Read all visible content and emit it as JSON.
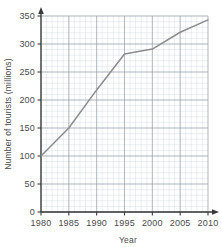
{
  "chart_data": {
    "type": "line",
    "title": "",
    "xlabel": "Year",
    "ylabel": "Number of tourists (millions)",
    "x": [
      1980,
      1985,
      1990,
      1995,
      2000,
      2005,
      2010
    ],
    "values": [
      100,
      150,
      218,
      282,
      291,
      321,
      343
    ],
    "series": [
      {
        "name": "Number of tourists",
        "values": [
          100,
          150,
          218,
          282,
          291,
          321,
          343
        ]
      }
    ],
    "xlim": [
      1980,
      2010
    ],
    "ylim": [
      0,
      350
    ],
    "x_ticks": [
      "1980",
      "1985",
      "1990",
      "1995",
      "2000",
      "2005",
      "2010"
    ],
    "y_ticks": [
      "0",
      "50",
      "100",
      "150",
      "200",
      "250",
      "300",
      "350"
    ],
    "x_minor_step": 1,
    "y_minor_step": 10,
    "grid": true,
    "legend": false,
    "line_color": "#8c8c8c",
    "grid_major_color": "#9aa3ad",
    "grid_minor_color": "#d7dde3",
    "axis_color": "#3a3a3a",
    "background_color": "#ffffff"
  },
  "axes": {
    "y_title": "Number of tourists (millions)",
    "x_title": "Year"
  },
  "ticks": {
    "y": [
      {
        "label": "350",
        "value": 350
      },
      {
        "label": "300",
        "value": 300
      },
      {
        "label": "250",
        "value": 250
      },
      {
        "label": "200",
        "value": 200
      },
      {
        "label": "150",
        "value": 150
      },
      {
        "label": "100",
        "value": 100
      },
      {
        "label": "50",
        "value": 50
      },
      {
        "label": "0",
        "value": 0
      }
    ],
    "x": [
      {
        "label": "1980",
        "value": 1980
      },
      {
        "label": "1985",
        "value": 1985
      },
      {
        "label": "1990",
        "value": 1990
      },
      {
        "label": "1995",
        "value": 1995
      },
      {
        "label": "2000",
        "value": 2000
      },
      {
        "label": "2005",
        "value": 2005
      },
      {
        "label": "2010",
        "value": 2010
      }
    ]
  }
}
